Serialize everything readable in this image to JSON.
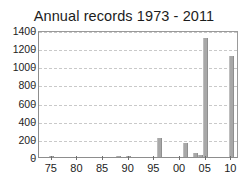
{
  "chart_data": {
    "type": "bar",
    "title": "Annual records 1973 - 2011",
    "xlabel": "",
    "ylabel": "",
    "ylim": [
      0,
      1400
    ],
    "xlim": [
      1972.5,
      2011.5
    ],
    "grid": true,
    "legend": null,
    "y_ticks": [
      0,
      200,
      400,
      600,
      800,
      1000,
      1200,
      1400
    ],
    "y_tick_labels": [
      "0",
      "200",
      "400",
      "600",
      "800",
      "1000",
      "1200",
      "1400"
    ],
    "x_ticks": [
      1975,
      1980,
      1985,
      1990,
      1995,
      2000,
      2005,
      2010
    ],
    "x_tick_labels": [
      "75",
      "80",
      "85",
      "90",
      "95",
      "00",
      "05",
      "10"
    ],
    "bar_color": "#a8a8a8",
    "grid_color": "#c9c9c9",
    "axis_color": "#8d8d8d",
    "text_color": "#1c1c1c",
    "categories": [
      1973,
      1974,
      1975,
      1976,
      1977,
      1978,
      1979,
      1980,
      1981,
      1982,
      1983,
      1984,
      1985,
      1986,
      1987,
      1988,
      1989,
      1990,
      1991,
      1992,
      1993,
      1994,
      1995,
      1996,
      1997,
      1998,
      1999,
      2000,
      2001,
      2002,
      2003,
      2004,
      2005,
      2006,
      2007,
      2008,
      2009,
      2010,
      2011
    ],
    "values": [
      0,
      0,
      4,
      0,
      0,
      0,
      0,
      0,
      0,
      0,
      0,
      0,
      0,
      0,
      0,
      5,
      0,
      3,
      0,
      0,
      0,
      0,
      0,
      205,
      0,
      0,
      0,
      0,
      160,
      0,
      45,
      25,
      1310,
      0,
      0,
      0,
      0,
      1110,
      0
    ]
  }
}
